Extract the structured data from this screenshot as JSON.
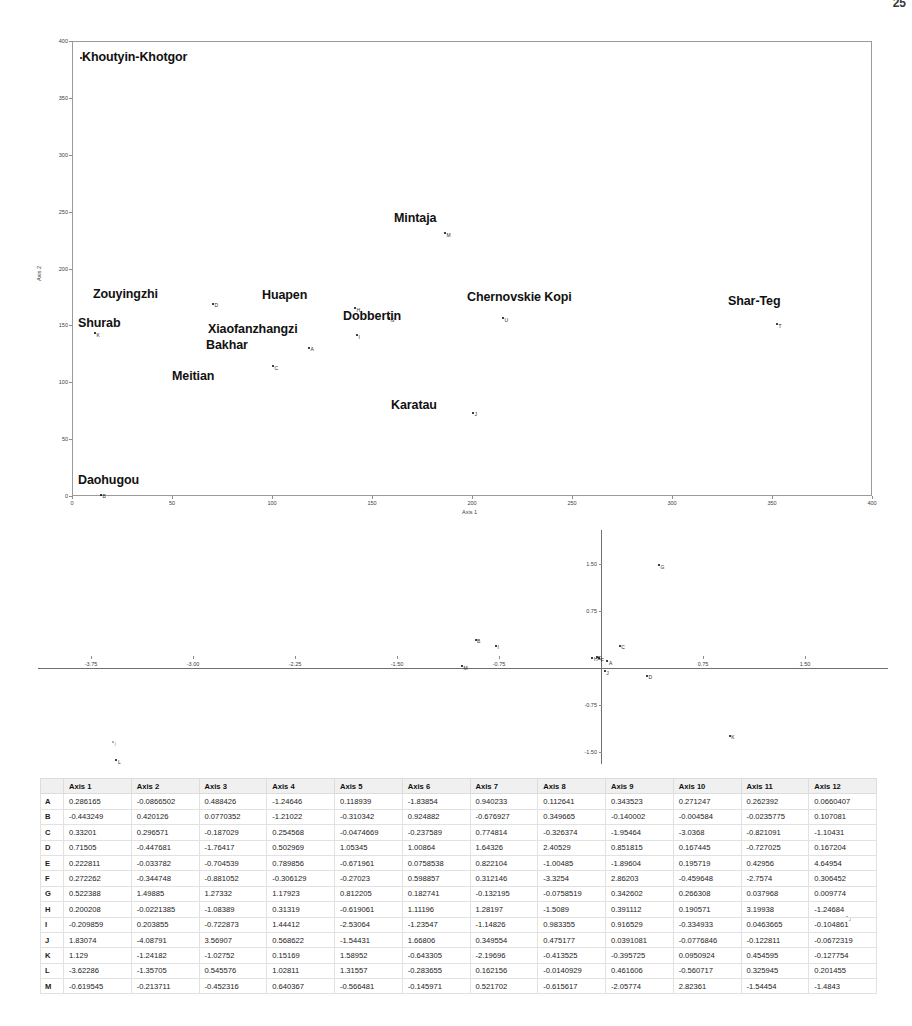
{
  "page": {
    "running_head": "",
    "folio": "25"
  },
  "plot_top": {
    "name": "ordination-scatter-axis1-axis2",
    "xlabel": "Axis 1",
    "ylabel": "Axis 2",
    "xticks": [
      "0",
      "50",
      "100",
      "150",
      "200",
      "250",
      "300",
      "350",
      "400"
    ],
    "yticks": [
      "0",
      "50",
      "100",
      "150",
      "200",
      "250",
      "300",
      "350",
      "400"
    ],
    "xlim": [
      0,
      400
    ],
    "ylim": [
      0,
      400
    ],
    "points": [
      {
        "label": "K",
        "site": "Khoutyin-Khotgor",
        "x": 4,
        "y": 386
      },
      {
        "label": "M",
        "site": "Mintaja",
        "x": 186,
        "y": 232
      },
      {
        "label": "D",
        "site": "Zouyingzhi",
        "x": 70,
        "y": 170
      },
      {
        "label": "H",
        "site": "Huapen",
        "x": 141,
        "y": 166
      },
      {
        "label": "G",
        "site": "Dobbertin",
        "x": 158,
        "y": 157
      },
      {
        "label": "U",
        "site": "Chernovskie Kopi",
        "x": 215,
        "y": 157
      },
      {
        "label": "T",
        "site": "Shar-Teg",
        "x": 352,
        "y": 152
      },
      {
        "label": "K",
        "site": "Shurab",
        "x": 11,
        "y": 144
      },
      {
        "label": "I",
        "site": "Xiaofanzhangzi",
        "x": 142,
        "y": 142
      },
      {
        "label": "A",
        "site": "Bakhar",
        "x": 118,
        "y": 131
      },
      {
        "label": "C",
        "site": "Meitian",
        "x": 100,
        "y": 115
      },
      {
        "label": "J",
        "site": "Karatau",
        "x": 200,
        "y": 74
      },
      {
        "label": "B",
        "site": "Daohugou",
        "x": 14,
        "y": 2
      }
    ],
    "site_labels": [
      {
        "text": "Khoutyin-Khotgor",
        "x": 82,
        "y": 50
      },
      {
        "text": "Mintaja",
        "x": 394,
        "y": 211
      },
      {
        "text": "Zouyingzhi",
        "x": 93,
        "y": 287
      },
      {
        "text": "Huapen",
        "x": 262,
        "y": 288
      },
      {
        "text": "Chernovskie Kopi",
        "x": 467,
        "y": 290
      },
      {
        "text": "Shar-Teg",
        "x": 728,
        "y": 294
      },
      {
        "text": "Dobbertin",
        "x": 343,
        "y": 309
      },
      {
        "text": "Shurab",
        "x": 78,
        "y": 316
      },
      {
        "text": "Xiaofanzhangzi",
        "x": 208,
        "y": 322
      },
      {
        "text": "Bakhar",
        "x": 206,
        "y": 338
      },
      {
        "text": "Meitian",
        "x": 172,
        "y": 369
      },
      {
        "text": "Karatau",
        "x": 391,
        "y": 398
      },
      {
        "text": "Daohugou",
        "x": 78,
        "y": 473
      }
    ]
  },
  "plot_mid": {
    "name": "ordination-scatter-secondary",
    "xticks": [
      "-3.75",
      "-3.00",
      "-2.25",
      "-1.50",
      "-0.75",
      "0.75",
      "1.50"
    ],
    "yticks": [
      "1.50",
      "0.75",
      "-0.75",
      "-1.50"
    ],
    "xlim": [
      -4.3,
      1.95
    ],
    "ylim": [
      -1.85,
      1.9
    ],
    "points": [
      {
        "label": "G",
        "x": 0.42,
        "y": 1.5
      },
      {
        "label": "B",
        "x": -0.93,
        "y": 0.31
      },
      {
        "label": "I",
        "x": -0.78,
        "y": 0.21
      },
      {
        "label": "C",
        "x": 0.13,
        "y": 0.21
      },
      {
        "label": "H",
        "x": -0.07,
        "y": 0.02
      },
      {
        "label": "E",
        "x": -0.04,
        "y": 0.04
      },
      {
        "label": "F",
        "x": -0.02,
        "y": 0.01
      },
      {
        "label": "A",
        "x": 0.04,
        "y": -0.04
      },
      {
        "label": "M",
        "x": -1.03,
        "y": -0.12
      },
      {
        "label": "J",
        "x": 0.02,
        "y": -0.2
      },
      {
        "label": "D",
        "x": 0.33,
        "y": -0.27
      },
      {
        "label": "K",
        "x": 0.94,
        "y": -1.23
      },
      {
        "label": "L",
        "x": -3.57,
        "y": -1.62
      }
    ]
  },
  "table": {
    "name": "ordination-coordinates-table",
    "columns": [
      "",
      "Axis 1",
      "Axis 2",
      "Axis 3",
      "Axis 4",
      "Axis 5",
      "Axis 6",
      "Axis 7",
      "Axis 8",
      "Axis 9",
      "Axis 10",
      "Axis 11",
      "Axis 12"
    ],
    "rows": [
      {
        "id": "A",
        "values": [
          "0.286165",
          "-0.0866502",
          "0.488426",
          "-1.24646",
          "0.118939",
          "-1.83854",
          "0.940233",
          "0.112641",
          "0.343523",
          "0.271247",
          "0.262392",
          "0.0660407"
        ]
      },
      {
        "id": "B",
        "values": [
          "-0.443249",
          "0.420126",
          "0.0770352",
          "-1.21022",
          "-0.310342",
          "0.924882",
          "-0.676927",
          "0.349665",
          "-0.140002",
          "-0.004584",
          "-0.0235775",
          "0.107081"
        ]
      },
      {
        "id": "C",
        "values": [
          "0.33201",
          "0.296571",
          "-0.187029",
          "0.254568",
          "-0.0474669",
          "-0.237589",
          "0.774814",
          "-0.326374",
          "-1.95464",
          "-3.0368",
          "-0.821091",
          "-1.10431"
        ]
      },
      {
        "id": "D",
        "values": [
          "0.71505",
          "-0.447681",
          "-1.76417",
          "0.502969",
          "1.05345",
          "1.00864",
          "1.64326",
          "2.40529",
          "0.851815",
          "0.167445",
          "-0.727025",
          "0.167204"
        ]
      },
      {
        "id": "E",
        "values": [
          "0.222811",
          "-0.033782",
          "-0.704539",
          "0.789856",
          "-0.671961",
          "0.0758538",
          "0.822104",
          "-1.00485",
          "-1.89604",
          "0.195719",
          "0.42956",
          "4.64954"
        ]
      },
      {
        "id": "F",
        "values": [
          "0.272262",
          "-0.344748",
          "-0.881052",
          "-0.306129",
          "-0.27023",
          "0.598857",
          "0.312146",
          "-3.3254",
          "2.86203",
          "-0.459648",
          "-2.7574",
          "0.306452"
        ]
      },
      {
        "id": "G",
        "values": [
          "0.522388",
          "1.49885",
          "1.27332",
          "1.17923",
          "0.812205",
          "0.182741",
          "-0.132195",
          "-0.0758519",
          "0.342602",
          "0.266308",
          "0.037968",
          "0.009774"
        ]
      },
      {
        "id": "H",
        "values": [
          "0.200208",
          "-0.0221385",
          "-1.08389",
          "0.31319",
          "-0.619061",
          "1.11196",
          "1.28197",
          "-1.5089",
          "0.391112",
          "0.190571",
          "3.19938",
          "-1.24684"
        ]
      },
      {
        "id": "I",
        "values": [
          "-0.209859",
          "0.203855",
          "-0.722873",
          "1.44412",
          "-2.53064",
          "-1.23547",
          "-1.14826",
          "0.983355",
          "0.916529",
          "-0.334933",
          "0.0463665",
          "-0.104861"
        ]
      },
      {
        "id": "J",
        "values": [
          "1.83074",
          "-4.08791",
          "3.56907",
          "0.568622",
          "-1.54431",
          "1.66806",
          "0.349554",
          "0.475177",
          "0.0391081",
          "-0.0776846",
          "-0.122811",
          "-0.0672319"
        ]
      },
      {
        "id": "K",
        "values": [
          "1.129",
          "-1.24182",
          "-1.02752",
          "0.15169",
          "1.58952",
          "-0.643305",
          "-2.19696",
          "-0.413525",
          "-0.395725",
          "0.0950924",
          "0.454595",
          "-0.127754"
        ]
      },
      {
        "id": "L",
        "values": [
          "-3.62286",
          "-1.35705",
          "0.545576",
          "1.02811",
          "1.31557",
          "-0.283655",
          "0.162156",
          "-0.0140929",
          "0.461606",
          "-0.560717",
          "0.325945",
          "0.201455"
        ]
      },
      {
        "id": "M",
        "values": [
          "-0.619545",
          "-0.213711",
          "-0.452316",
          "0.640367",
          "-0.566481",
          "-0.145971",
          "0.521702",
          "-0.615617",
          "-2.05774",
          "2.82361",
          "-1.54454",
          "-1.4843"
        ]
      }
    ]
  },
  "strays": [
    {
      "label": "I",
      "x": 112,
      "y": 741
    },
    {
      "label": "J",
      "x": 846,
      "y": 916
    }
  ]
}
